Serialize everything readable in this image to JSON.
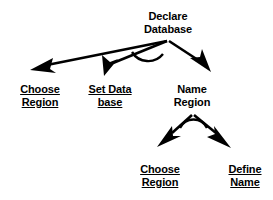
{
  "diagram": {
    "type": "task-hierarchy-tree",
    "background_color": "#ffffff",
    "stroke_color": "#000000",
    "text_color": "#000000"
  },
  "nodes": {
    "root": {
      "id": "declare-database",
      "line1": "Declare",
      "line2": "Database",
      "underlined": false,
      "x": 168,
      "y": 10
    },
    "choose_region_1": {
      "id": "choose-region-1",
      "line1": "Choose",
      "line2": "Region",
      "underlined": true,
      "x": 40,
      "y": 83
    },
    "set_database": {
      "id": "set-database",
      "line1": "Set Data",
      "line2": "base",
      "underlined": true,
      "x": 110,
      "y": 83
    },
    "name_region": {
      "id": "name-region",
      "line1": "Name",
      "line2": "Region",
      "underlined": false,
      "x": 192,
      "y": 83
    },
    "choose_region_2": {
      "id": "choose-region-2",
      "line1": "Choose",
      "line2": "Region",
      "underlined": true,
      "x": 160,
      "y": 163
    },
    "define_name": {
      "id": "define-name",
      "line1": "Define",
      "line2": "Name",
      "underlined": true,
      "x": 245,
      "y": 163
    }
  },
  "edges": [
    {
      "id": "edge-root-to-choose-region",
      "from": "declare-database",
      "to": "choose-region-1"
    },
    {
      "id": "edge-root-to-set-database",
      "from": "declare-database",
      "to": "set-database"
    },
    {
      "id": "edge-root-to-name-region",
      "from": "declare-database",
      "to": "name-region"
    },
    {
      "id": "edge-name-region-to-choose-region",
      "from": "name-region",
      "to": "choose-region-2"
    },
    {
      "id": "edge-name-region-to-define-name",
      "from": "name-region",
      "to": "define-name"
    }
  ],
  "sequence_arcs": [
    {
      "id": "arc-root",
      "at": "declare-database"
    },
    {
      "id": "arc-name-region",
      "at": "name-region"
    }
  ]
}
